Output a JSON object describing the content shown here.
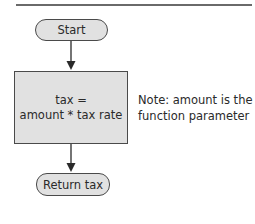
{
  "diagram": {
    "type": "flowchart",
    "nodes": {
      "start": {
        "shape": "terminal",
        "label": "Start"
      },
      "process": {
        "shape": "process",
        "lines": [
          "tax =",
          "amount * tax rate"
        ]
      },
      "end": {
        "shape": "terminal",
        "label": "Return tax"
      }
    },
    "annotation": {
      "lines": [
        "Note: amount is the",
        "function parameter"
      ]
    },
    "edges": [
      {
        "from": "start",
        "to": "process"
      },
      {
        "from": "process",
        "to": "end"
      }
    ],
    "colors": {
      "fill": "#e1e1e1",
      "stroke": "#4a4a4a",
      "rule": "#6a6a6a"
    }
  }
}
